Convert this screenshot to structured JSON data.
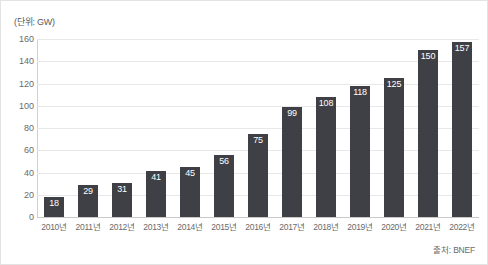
{
  "unit_label": "(단위: GW)",
  "source_note": "출처: BNEF",
  "colors": {
    "bar": "#3f3f46",
    "bar_label": "#ffffff",
    "gridline": "#e8e8e8",
    "axis": "#c9c9c9",
    "tick_text": "#6a6a6a",
    "background": "#ffffff",
    "frame": "#e3e3e3"
  },
  "chart_data": {
    "type": "bar",
    "title": "",
    "subtitle": "",
    "xlabel": "",
    "ylabel": "",
    "unit": "GW",
    "unit_caption": "(단위: GW)",
    "source": "출처: BNEF",
    "categories": [
      "2010년",
      "2011년",
      "2012년",
      "2013년",
      "2014년",
      "2015년",
      "2016년",
      "2017년",
      "2018년",
      "2019년",
      "2020년",
      "2021년",
      "2022년"
    ],
    "values": [
      18,
      29,
      31,
      41,
      45,
      56,
      75,
      99,
      108,
      118,
      125,
      150,
      157
    ],
    "ylim": [
      0,
      160
    ],
    "yticks": [
      0,
      20,
      40,
      60,
      80,
      100,
      120,
      140,
      160
    ],
    "ytick_labels": [
      "0",
      "20",
      "40",
      "60",
      "80",
      "100",
      "120",
      "140",
      "160"
    ],
    "grid": true,
    "grid_axis": "y",
    "legend": false,
    "legend_position": "none",
    "data_labels": true,
    "data_label_position": "inside-top"
  }
}
